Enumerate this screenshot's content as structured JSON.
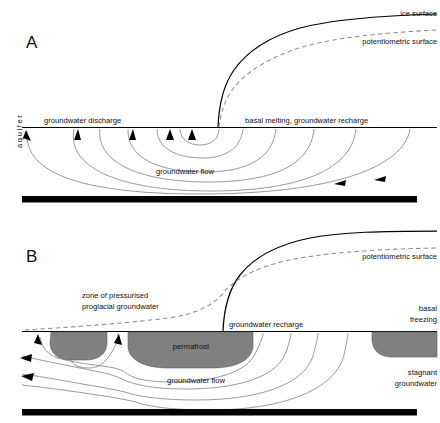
{
  "figure": {
    "type": "scientific-cross-section-diagram",
    "background_color": "#ffffff",
    "line_color": "#000000",
    "flowline_color": "#6e6e6e",
    "potentiometric_color": "#8c8c8c",
    "permafrost_fill": "#808080",
    "bedrock_fill": "#000000"
  },
  "panels": [
    {
      "id": "A",
      "label": "A",
      "labels": {
        "ice_surface": "ice surface",
        "potentiometric_surface": "potentiometric surface",
        "groundwater_discharge": "groundwater discharge",
        "basal_condition": "basal melting, groundwater recharge",
        "groundwater_flow": "groundwater flow",
        "aquifer": "aquifer"
      }
    },
    {
      "id": "B",
      "label": "B",
      "labels": {
        "potentiometric_surface": "potentiometric surface",
        "pressurised_zone_line1": "zone of pressurised",
        "pressurised_zone_line2": "proglacial groundwater",
        "groundwater_recharge": "groundwater recharge",
        "permafrost": "permafrost",
        "basal_line1": "basal",
        "basal_line2": "freezing",
        "stagnant_line1": "stagnant",
        "stagnant_line2": "groundwater",
        "groundwater_flow": "groundwater flow"
      }
    }
  ]
}
